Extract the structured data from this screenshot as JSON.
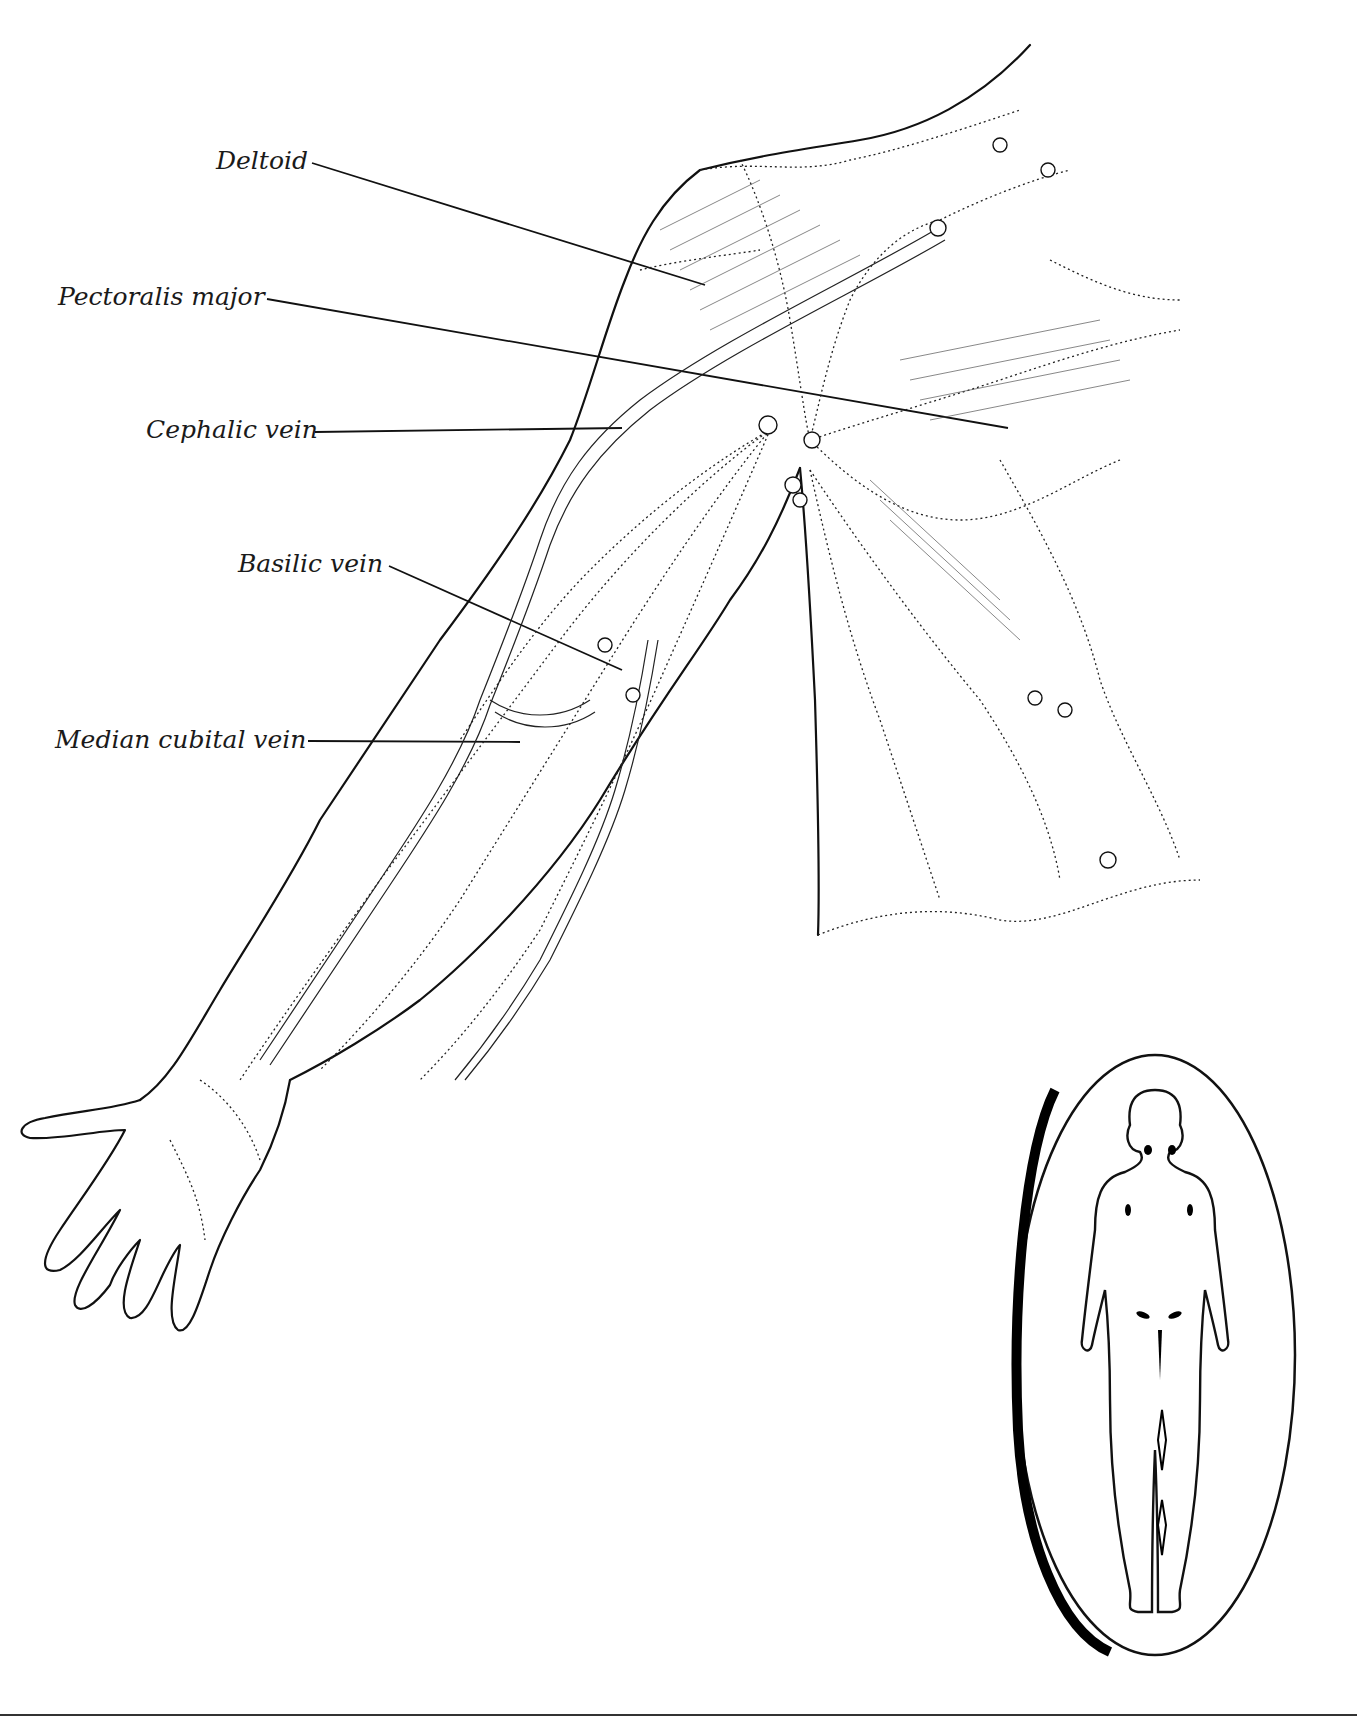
{
  "figure": {
    "labels": [
      {
        "id": "deltoid",
        "text": "Deltoid"
      },
      {
        "id": "pectoralis_major",
        "text": "Pectoralis major"
      },
      {
        "id": "cephalic_vein",
        "text": "Cephalic vein"
      },
      {
        "id": "basilic_vein",
        "text": "Basilic vein"
      },
      {
        "id": "median_cubital_vein",
        "text": "Median cubital vein"
      }
    ],
    "inset": {
      "description": "Full-body outline with highlighted lymph node regions",
      "highlighted_regions": [
        "cervical",
        "axillary",
        "inguinal",
        "popliteal"
      ]
    }
  }
}
